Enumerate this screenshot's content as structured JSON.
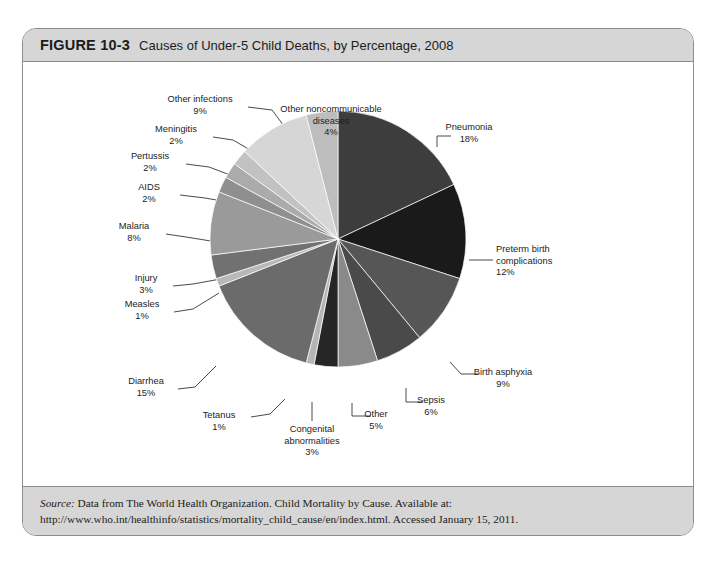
{
  "figure": {
    "number": "FIGURE 10-3",
    "caption": "Causes of Under-5 Child Deaths, by Percentage, 2008",
    "source_label": "Source:",
    "source_text": " Data from The World Health Organization. Child Mortality by Cause. Available at: http://www.who.int/healthinfo/statistics/mortality_child_cause/en/index.html. Accessed January 15, 2011."
  },
  "chart_data": {
    "type": "pie",
    "title": "Causes of Under-5 Child Deaths, by Percentage, 2008",
    "unit": "%",
    "start_angle_deg": 0,
    "direction": "clockwise",
    "legend": "none (direct labels with leader lines)",
    "categories": [
      "Pneumonia",
      "Preterm birth complications",
      "Birth asphyxia",
      "Sepsis",
      "Other",
      "Congenital abnormalities",
      "Tetanus",
      "Diarrhea",
      "Measles",
      "Injury",
      "Malaria",
      "AIDS",
      "Pertussis",
      "Meningitis",
      "Other infections",
      "Other noncommunicable diseases"
    ],
    "values": [
      18,
      12,
      9,
      6,
      5,
      3,
      1,
      15,
      1,
      3,
      8,
      2,
      2,
      2,
      9,
      4
    ],
    "colors": [
      "#3d3d3d",
      "#1a1a1a",
      "#565656",
      "#4a4a4a",
      "#8a8a8a",
      "#262626",
      "#b5b5b5",
      "#6b6b6b",
      "#b8b8b8",
      "#717171",
      "#9a9a9a",
      "#8f8f8f",
      "#ababab",
      "#c2c2c2",
      "#d6d6d6",
      "#bdbdbd"
    ],
    "slices": [
      {
        "label": "Pneumonia",
        "pct": "18%",
        "value": 18,
        "color": "#3d3d3d"
      },
      {
        "label": "Preterm birth complications",
        "pct": "12%",
        "value": 12,
        "color": "#1a1a1a"
      },
      {
        "label": "Birth asphyxia",
        "pct": "9%",
        "value": 9,
        "color": "#565656"
      },
      {
        "label": "Sepsis",
        "pct": "6%",
        "value": 6,
        "color": "#4a4a4a"
      },
      {
        "label": "Other",
        "pct": "5%",
        "value": 5,
        "color": "#8a8a8a"
      },
      {
        "label": "Congenital abnormalities",
        "pct": "3%",
        "value": 3,
        "color": "#262626"
      },
      {
        "label": "Tetanus",
        "pct": "1%",
        "value": 1,
        "color": "#b5b5b5"
      },
      {
        "label": "Diarrhea",
        "pct": "15%",
        "value": 15,
        "color": "#6b6b6b"
      },
      {
        "label": "Measles",
        "pct": "1%",
        "value": 1,
        "color": "#b8b8b8"
      },
      {
        "label": "Injury",
        "pct": "3%",
        "value": 3,
        "color": "#717171"
      },
      {
        "label": "Malaria",
        "pct": "8%",
        "value": 8,
        "color": "#9a9a9a"
      },
      {
        "label": "AIDS",
        "pct": "2%",
        "value": 2,
        "color": "#8f8f8f"
      },
      {
        "label": "Pertussis",
        "pct": "2%",
        "value": 2,
        "color": "#ababab"
      },
      {
        "label": "Meningitis",
        "pct": "2%",
        "value": 2,
        "color": "#c2c2c2"
      },
      {
        "label": "Other infections",
        "pct": "9%",
        "value": 9,
        "color": "#d6d6d6"
      },
      {
        "label": "Other noncommunicable diseases",
        "pct": "4%",
        "value": 4,
        "color": "#bdbdbd"
      }
    ]
  },
  "labels": {
    "other_noncommunicable_l1": "Other noncommunicable",
    "other_noncommunicable_l2": "diseases",
    "other_noncommunicable_pct": "4%",
    "other_infections": "Other infections",
    "other_infections_pct": "9%",
    "meningitis": "Meningitis",
    "meningitis_pct": "2%",
    "pertussis": "Pertussis",
    "pertussis_pct": "2%",
    "aids": "AIDS",
    "aids_pct": "2%",
    "malaria": "Malaria",
    "malaria_pct": "8%",
    "injury": "Injury",
    "injury_pct": "3%",
    "measles": "Measles",
    "measles_pct": "1%",
    "diarrhea": "Diarrhea",
    "diarrhea_pct": "15%",
    "tetanus": "Tetanus",
    "tetanus_pct": "1%",
    "congenital_l1": "Congenital",
    "congenital_l2": "abnormalities",
    "congenital_pct": "3%",
    "other": "Other",
    "other_pct": "5%",
    "sepsis": "Sepsis",
    "sepsis_pct": "6%",
    "birth_asphyxia": "Birth asphyxia",
    "birth_asphyxia_pct": "9%",
    "preterm_l1": "Preterm birth",
    "preterm_l2": "complications",
    "preterm_pct": "12%",
    "pneumonia": "Pneumonia",
    "pneumonia_pct": "18%"
  }
}
